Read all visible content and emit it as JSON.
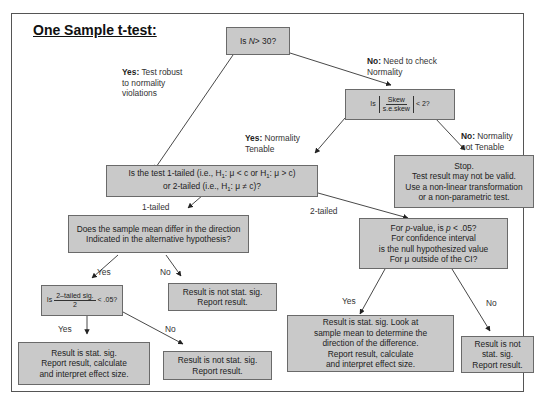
{
  "title": "One Sample t-test:",
  "nodes": {
    "n_check": {
      "text_pre": "Is ",
      "var": "N",
      "text_post": " > 30?"
    },
    "skew_check": {
      "pre": "Is",
      "num": "Skew",
      "den": "s.e.skew",
      "post": "< 2?"
    },
    "tail_question": {
      "line1": "Is the test 1-tailed (i.e., H",
      "line1b": ": μ < c or H",
      "line1c": ": μ > c)",
      "line2": "or 2-tailed (i.e., H",
      "line2b": ": μ ≠ c)?",
      "sub": "1"
    },
    "stop": [
      "Stop.",
      "Test result may not be valid.",
      "Use a non-linear transformation",
      "or a non-parametric test."
    ],
    "direction_question": [
      "Does the sample mean differ in the direction",
      "Indicated in the alternative hypothesis?"
    ],
    "p_question": [
      "For p-value, is p < .05?",
      "For confidence interval",
      "is the null hypothesized value",
      "For μ outside of the CI?"
    ],
    "half_sig": {
      "pre": "Is",
      "num": "2–tailed sig.",
      "den": "2",
      "post": "< .05?"
    },
    "not_sig_direction": [
      "Result is not stat. sig.",
      "Report result."
    ],
    "sig_1tailed": [
      "Result is stat. sig.",
      "Report result, calculate",
      "and interpret effect size."
    ],
    "not_sig_1tailed": [
      "Result is not stat. sig.",
      "Report result."
    ],
    "sig_2tailed": [
      "Result is stat. sig. Look at",
      "sample mean to determine the",
      "direction of the difference.",
      "Report result, calculate",
      "and interpret effect size."
    ],
    "not_sig_2tailed": [
      "Result is not",
      "stat. sig.",
      "Report result."
    ]
  },
  "edges": {
    "yes_robust": {
      "bold": "Yes:",
      "text": [
        " Test robust",
        "to normality",
        "violations"
      ]
    },
    "no_check": {
      "bold": "No:",
      "text": [
        " Need to check",
        "Normality"
      ]
    },
    "yes_tenable": {
      "bold": "Yes:",
      "text": [
        " Normality",
        "Tenable"
      ]
    },
    "no_tenable": {
      "bold": "No:",
      "text": [
        " Normality",
        "not Tenable"
      ]
    },
    "one_tailed": "1-tailed",
    "two_tailed": "2-tailed",
    "dir_yes": "Yes",
    "dir_no": "No",
    "half_yes": "Yes",
    "half_no": "No",
    "p_yes": "Yes",
    "p_no": "No"
  },
  "colors": {
    "box_fill": "#c9c9c9",
    "box_border": "#6a6a6a",
    "line": "#333333"
  }
}
